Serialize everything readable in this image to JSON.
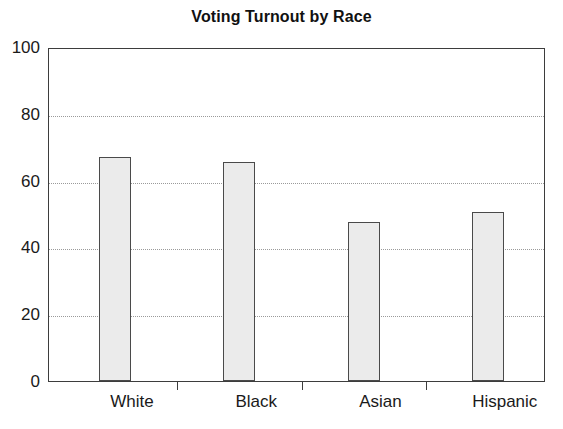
{
  "chart_data": {
    "type": "bar",
    "title": "Voting Turnout by Race",
    "xlabel": "",
    "ylabel": "",
    "categories": [
      "White",
      "Black",
      "Asian",
      "Hispanic"
    ],
    "values": [
      67,
      65.5,
      47.5,
      50.5
    ],
    "series": [
      {
        "name": "Voting Turnout",
        "values": [
          67,
          65.5,
          47.5,
          50.5
        ]
      }
    ],
    "ylim": [
      0,
      100
    ],
    "yticks": [
      0,
      20,
      40,
      60,
      80,
      100
    ],
    "ytick_labels": [
      "0",
      "20",
      "40",
      "60",
      "80",
      "100"
    ],
    "grid": "horizontal-dotted",
    "legend": "none",
    "bar_fill_color": "#ebebeb",
    "bar_edge_color": "#4a4a4a",
    "gridline_color": "#9a9a9a",
    "axis_color": "#3d3d3d",
    "background_color": "#ffffff"
  }
}
